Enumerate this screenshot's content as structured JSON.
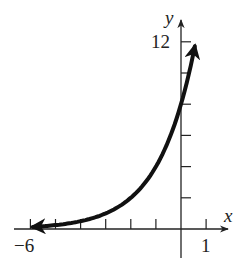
{
  "chart_data": {
    "type": "line",
    "title": "",
    "xlabel": "x",
    "ylabel": "y",
    "xlim": [
      -6,
      1
    ],
    "ylim": [
      0,
      12
    ],
    "x_tick_labels_shown": [
      "-6",
      "1"
    ],
    "y_tick_labels_shown": [
      "12"
    ],
    "x_ticks": [
      -6,
      -5,
      -4,
      -3,
      -2,
      -1,
      1
    ],
    "y_ticks": [
      2,
      4,
      6,
      8,
      10,
      12
    ],
    "grid": false,
    "legend": null,
    "series": [
      {
        "name": "exponential curve",
        "function_estimate": "y = 8 * 2^x",
        "x": [
          -6,
          -5,
          -4,
          -3,
          -2,
          -1,
          0,
          0.5
        ],
        "values": [
          0.13,
          0.25,
          0.5,
          1.0,
          2.0,
          4.0,
          8.0,
          11.3
        ],
        "arrows_both_ends": true
      }
    ]
  },
  "axes": {
    "x_label": "x",
    "y_label": "y",
    "x_min_label": "−6",
    "x_max_label": "1",
    "y_max_label": "12"
  }
}
